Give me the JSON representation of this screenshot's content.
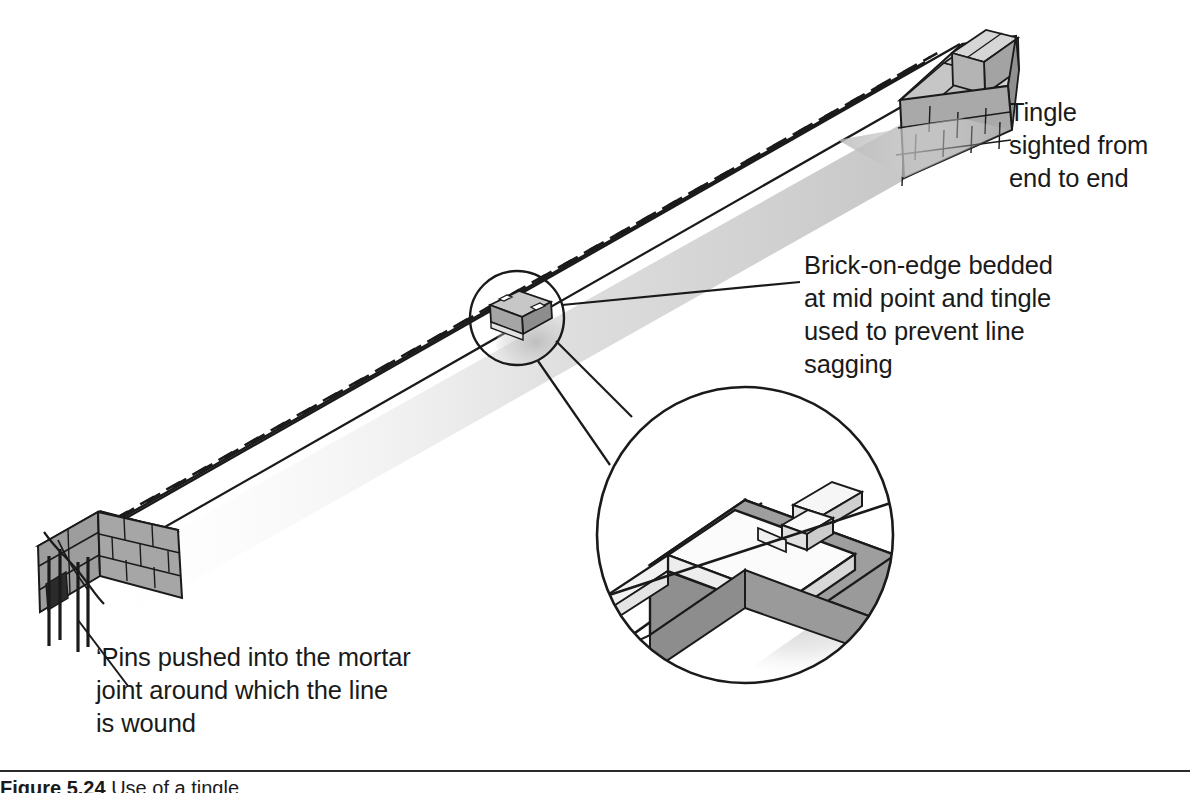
{
  "figure": {
    "caption_number": "Figure 5.24",
    "caption_text": "Use of a tingle",
    "alt_title": "Bricklaying line, pins and tingle diagram"
  },
  "annotations": [
    {
      "id": "tingle-sighted",
      "text": "Tingle\nsighted from\nend to end"
    },
    {
      "id": "brick-on-edge",
      "text": "Brick-on-edge bedded\nat mid point and tingle\nused to prevent line\nsagging"
    },
    {
      "id": "pins",
      "text": "‘Pins pushed into the mortar\njoint around which the line\nis wound"
    }
  ],
  "drawing": {
    "parts": [
      {
        "name": "wall-run",
        "label": "Long brick wall run in isometric projection"
      },
      {
        "name": "left-wall-end",
        "label": "Left brick wall end with pins"
      },
      {
        "name": "right-wall-end",
        "label": "Right brick wall end"
      },
      {
        "name": "pins",
        "label": "Line pins pushed into mortar joint"
      },
      {
        "name": "string-line",
        "label": "Bricklayer's line shown dashed along wall top"
      },
      {
        "name": "tingle-detail-circle",
        "label": "Small circle marking tingle at mid point"
      },
      {
        "name": "magnified-detail-circle",
        "label": "Enlarged detail of brick-on-edge and tingle"
      }
    ],
    "colors": {
      "outline": "#1a1a1a",
      "brick_face_dark": "#8f8f8f",
      "brick_face_mid": "#a8a8a8",
      "brick_face_light": "#c9c9c9",
      "brick_top_light": "#d8d8d8",
      "wall_top_white": "#ffffff",
      "detail_gray": "#9a9a9a",
      "detail_gray_dark": "#8a8a8a",
      "shadow_gray": "#c4c4c4",
      "text": "#1a1a1a"
    }
  }
}
